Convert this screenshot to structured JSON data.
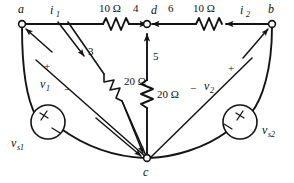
{
  "diagram": {
    "type": "electrical-schematic",
    "nodes": [
      {
        "id": "a",
        "label": "a",
        "x": 22,
        "y": 24
      },
      {
        "id": "b",
        "label": "b",
        "x": 272,
        "y": 24
      },
      {
        "id": "c",
        "label": "c",
        "x": 147,
        "y": 158
      },
      {
        "id": "d",
        "label": "d",
        "x": 147,
        "y": 24
      }
    ],
    "components": [
      {
        "id": "r-ad",
        "type": "resistor",
        "value": "10 Ω",
        "orientation": "horizontal",
        "between": [
          "a",
          "d"
        ]
      },
      {
        "id": "r-db",
        "type": "resistor",
        "value": "10 Ω",
        "orientation": "horizontal",
        "between": [
          "d",
          "b"
        ]
      },
      {
        "id": "r-ac",
        "type": "resistor",
        "value": "20 Ω",
        "orientation": "diagonal",
        "between": [
          "a",
          "c"
        ]
      },
      {
        "id": "r-dc",
        "type": "resistor",
        "value": "20 Ω",
        "orientation": "vertical",
        "between": [
          "d",
          "c"
        ]
      },
      {
        "id": "src-left",
        "type": "voltage-source",
        "label": "v",
        "sublabel": "s1",
        "between": [
          "a",
          "c"
        ]
      },
      {
        "id": "src-right",
        "type": "voltage-source",
        "label": "v",
        "sublabel": "s2",
        "between": [
          "b",
          "c"
        ]
      }
    ],
    "currents": [
      {
        "id": "i1",
        "label": "i",
        "sublabel": "1",
        "direction": "right"
      },
      {
        "id": "i2",
        "label": "i",
        "sublabel": "2",
        "direction": "left"
      },
      {
        "id": "c3",
        "label": "3",
        "direction": "down-right"
      },
      {
        "id": "c4",
        "label": "4",
        "direction": "right"
      },
      {
        "id": "c5",
        "label": "5",
        "direction": "up"
      },
      {
        "id": "c6",
        "label": "6",
        "direction": "left"
      }
    ],
    "voltages": [
      {
        "id": "v1",
        "label": "v",
        "sublabel": "1",
        "plus": "+",
        "minus": "−",
        "plus_position": "upper-left",
        "minus_position": "lower-right"
      },
      {
        "id": "v2",
        "label": "v",
        "sublabel": "2",
        "plus": "+",
        "minus": "−",
        "plus_position": "upper-right",
        "minus_position": "lower-left"
      }
    ],
    "ohm_symbol": "Ω",
    "colors": {
      "wire": "#141414",
      "background": "#ffffff",
      "text": "#111111"
    }
  }
}
